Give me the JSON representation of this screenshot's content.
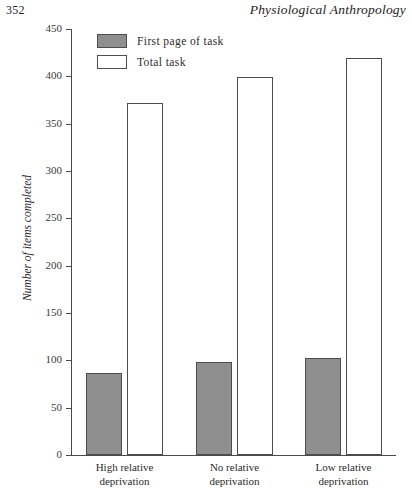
{
  "page": {
    "number": "352",
    "running_head": "Physiological Anthropology"
  },
  "chart_data": {
    "type": "bar",
    "title": "",
    "xlabel": "",
    "ylabel": "Number of items completed",
    "ylim": [
      0,
      450
    ],
    "yticks": [
      0,
      50,
      100,
      150,
      200,
      250,
      300,
      350,
      400,
      450
    ],
    "ytick_labels": [
      "0",
      "50",
      "100",
      "150",
      "200",
      "250",
      "300",
      "350",
      "400",
      "450"
    ],
    "grid": false,
    "legend_position": "top-left",
    "categories": [
      "High relative deprivation",
      "No relative deprivation",
      "Low relative deprivation"
    ],
    "category_lines": [
      [
        "High relative",
        "deprivation"
      ],
      [
        "No relative",
        "deprivation"
      ],
      [
        "Low relative",
        "deprivation"
      ]
    ],
    "series": [
      {
        "name": "First page of task",
        "fill": "#8f8f8f",
        "values": [
          87,
          98,
          102
        ]
      },
      {
        "name": "Total task",
        "fill": "#ffffff",
        "values": [
          372,
          399,
          419
        ]
      }
    ]
  },
  "legend": {
    "items": [
      {
        "label": "First page of task",
        "swatch": "filled-gray"
      },
      {
        "label": "Total task",
        "swatch": "outline-white"
      }
    ]
  },
  "colors": {
    "bar_fill_gray": "#8f8f8f",
    "bar_fill_white": "#ffffff",
    "bar_stroke": "#4d4d4d",
    "axis": "#4a4a4a",
    "text": "#2c2c2c"
  }
}
